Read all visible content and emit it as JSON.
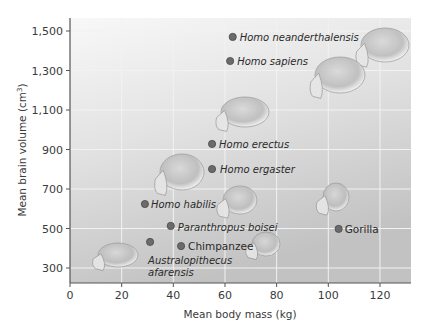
{
  "chart_data": {
    "type": "scatter",
    "title": "",
    "xlabel": "Mean body mass (kg)",
    "ylabel": "Mean brain volume (cm³)",
    "ylabel_base": "Mean brain volume (cm",
    "ylabel_sup": "3",
    "ylabel_close": ")",
    "xlim": [
      0,
      131
    ],
    "ylim": [
      225,
      1565
    ],
    "xticks": [
      0,
      20,
      40,
      60,
      80,
      100,
      120
    ],
    "xtick_labels": [
      "0",
      "20",
      "40",
      "60",
      "80",
      "100",
      "120"
    ],
    "yticks": [
      300,
      500,
      700,
      900,
      1100,
      1300,
      1500
    ],
    "ytick_labels": [
      "300",
      "500",
      "700",
      "900",
      "1,100",
      "1,300",
      "1,500"
    ],
    "grid": true,
    "legend": null,
    "points": [
      {
        "name": "Homo neanderthalensis",
        "x": 63,
        "y": 1470,
        "italic": true,
        "label_dx": 7,
        "label_dy": 4
      },
      {
        "name": "Homo sapiens",
        "x": 62,
        "y": 1348,
        "italic": true,
        "label_dx": 7,
        "label_dy": 4
      },
      {
        "name": "Homo erectus",
        "x": 55,
        "y": 928,
        "italic": true,
        "label_dx": 7,
        "label_dy": 4
      },
      {
        "name": "Homo ergaster",
        "x": 55,
        "y": 801,
        "italic": true,
        "label_dx": 8,
        "label_dy": 4
      },
      {
        "name": "Homo habilis",
        "x": 29,
        "y": 624,
        "italic": true,
        "label_dx": 6,
        "label_dy": 4
      },
      {
        "name": "Paranthropus boisei",
        "x": 39,
        "y": 513,
        "italic": true,
        "label_dx": 7,
        "label_dy": 5
      },
      {
        "name": "Chimpanzee",
        "x": 43,
        "y": 411,
        "italic": false,
        "label_dx": 7,
        "label_dy": 4
      },
      {
        "name": "Australopithecus afarensis",
        "x": 31,
        "y": 432,
        "italic": true,
        "label_lines": [
          "Australopithecus",
          "afarensis"
        ],
        "label_dx": -2,
        "label_dy": 22
      },
      {
        "name": "Gorilla",
        "x": 104,
        "y": 498,
        "italic": false,
        "label_dx": 6,
        "label_dy": 4
      }
    ],
    "annotations": [
      "skull illustrations adjacent to species points"
    ]
  },
  "colors": {
    "point": "#6b6b6b",
    "point_stroke": "#4a4a4a",
    "grid": "#f2f2f2",
    "axis": "#555555",
    "bg_top": "#f7f7f7",
    "bg_bottom": "#c4c4c4"
  }
}
